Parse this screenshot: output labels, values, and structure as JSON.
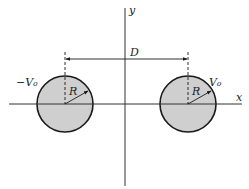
{
  "diagram": {
    "axes": {
      "x_label": "x",
      "y_label": "y"
    },
    "separation_label": "D",
    "left_cylinder": {
      "potential_label": "−V₀",
      "radius_label": "R"
    },
    "right_cylinder": {
      "potential_label": "V₀",
      "radius_label": "R"
    },
    "colors": {
      "fill": "#cfcfcf",
      "stroke": "#1a1a1a",
      "background": "#ffffff"
    }
  }
}
